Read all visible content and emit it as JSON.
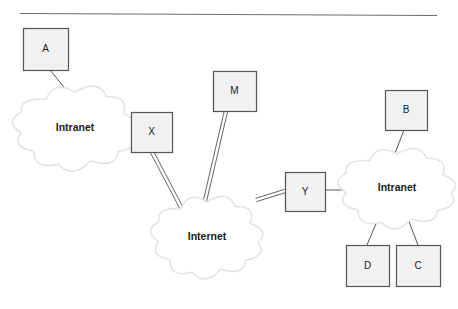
{
  "diagram": {
    "top_rule": {
      "x1": 20,
      "y1": 13,
      "x2": 437,
      "y2": 15
    },
    "colors": {
      "box_fill": "#f1f1f1",
      "box_stroke": "#555555",
      "cloud_fill": "#ffffff",
      "cloud_stroke": "#e3e3e3",
      "link_stroke": "#555555",
      "text": "#1a1a1a",
      "rule": "#6b6b6b",
      "background": "#ffffff"
    },
    "clouds": [
      {
        "id": "intranet-left",
        "label": "Intranet",
        "cx": 75,
        "cy": 128,
        "rx": 56,
        "ry": 36
      },
      {
        "id": "internet",
        "label": "Internet",
        "cx": 207,
        "cy": 237,
        "rx": 50,
        "ry": 35
      },
      {
        "id": "intranet-right",
        "label": "Intranet",
        "cx": 397,
        "cy": 188,
        "rx": 53,
        "ry": 34
      }
    ],
    "boxes": [
      {
        "id": "node-a",
        "label": "A",
        "x": 23,
        "y": 28,
        "w": 45,
        "h": 42
      },
      {
        "id": "node-x",
        "label": "X",
        "x": 131,
        "y": 112,
        "w": 41,
        "h": 40
      },
      {
        "id": "node-m",
        "label": "M",
        "x": 213,
        "y": 71,
        "w": 43,
        "h": 40
      },
      {
        "id": "node-y",
        "label": "Y",
        "x": 285,
        "y": 172,
        "w": 40,
        "h": 39
      },
      {
        "id": "node-b",
        "label": "B",
        "x": 385,
        "y": 90,
        "w": 42,
        "h": 40
      },
      {
        "id": "node-d",
        "label": "D",
        "x": 346,
        "y": 245,
        "w": 43,
        "h": 41
      },
      {
        "id": "node-c",
        "label": "C",
        "x": 396,
        "y": 245,
        "w": 44,
        "h": 41
      }
    ],
    "links": [
      {
        "id": "link-a-intranet-left",
        "from": "node-a",
        "to": "intranet-left",
        "kind": "single",
        "x1": 50,
        "y1": 70,
        "x2": 76,
        "y2": 102
      },
      {
        "id": "link-intranet-left-x",
        "from": "intranet-left",
        "to": "node-x",
        "kind": "single",
        "x1": 113,
        "y1": 131,
        "x2": 131,
        "y2": 131
      },
      {
        "id": "link-x-internet",
        "from": "node-x",
        "to": "internet",
        "kind": "double",
        "x1": 152,
        "y1": 152,
        "x2": 182,
        "y2": 209
      },
      {
        "id": "link-m-internet",
        "from": "node-m",
        "to": "internet",
        "kind": "double",
        "x1": 226,
        "y1": 111,
        "x2": 204,
        "y2": 205
      },
      {
        "id": "link-internet-y",
        "from": "internet",
        "to": "node-y",
        "kind": "double",
        "x1": 256,
        "y1": 200,
        "x2": 285,
        "y2": 191
      },
      {
        "id": "link-y-intranet-right",
        "from": "node-y",
        "to": "intranet-right",
        "kind": "single",
        "x1": 325,
        "y1": 190,
        "x2": 354,
        "y2": 190
      },
      {
        "id": "link-b-intranet-right",
        "from": "node-b",
        "to": "intranet-right",
        "kind": "single",
        "x1": 404,
        "y1": 130,
        "x2": 392,
        "y2": 161
      },
      {
        "id": "link-intranet-right-d",
        "from": "intranet-right",
        "to": "node-d",
        "kind": "single",
        "x1": 378,
        "y1": 219,
        "x2": 367,
        "y2": 245
      },
      {
        "id": "link-intranet-right-c",
        "from": "intranet-right",
        "to": "node-c",
        "kind": "single",
        "x1": 408,
        "y1": 219,
        "x2": 418,
        "y2": 245
      }
    ]
  }
}
